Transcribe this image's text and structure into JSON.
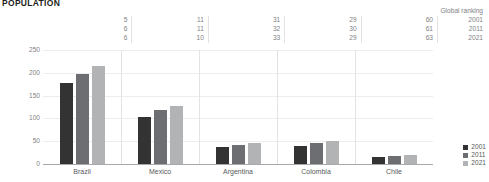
{
  "title": "POPULATION",
  "chart_data": {
    "type": "bar",
    "title": "POPULATION",
    "xlabel": "",
    "ylabel": "Millions",
    "ylim": [
      0,
      250
    ],
    "yticks": [
      250,
      200,
      150,
      100,
      50,
      0
    ],
    "grid": true,
    "legend_position": "right-bottom",
    "categories": [
      "Brazil",
      "Mexico",
      "Argentina",
      "Colombia",
      "Chile"
    ],
    "series": [
      {
        "name": "2001",
        "values": [
          177,
          103,
          37,
          40,
          15
        ]
      },
      {
        "name": "2011",
        "values": [
          197,
          118,
          41,
          46,
          17
        ]
      },
      {
        "name": "2021",
        "values": [
          214,
          128,
          46,
          51,
          19
        ]
      }
    ],
    "annotations": {
      "header": "Global ranking",
      "rows": [
        {
          "year": "2001",
          "values": [
            5,
            11,
            31,
            29,
            60
          ]
        },
        {
          "year": "2011",
          "values": [
            6,
            11,
            32,
            30,
            61
          ]
        },
        {
          "year": "2021",
          "values": [
            6,
            10,
            33,
            29,
            63
          ]
        }
      ]
    }
  },
  "legend": [
    {
      "label": "2001"
    },
    {
      "label": "2011"
    },
    {
      "label": "2021"
    }
  ],
  "colors": {
    "series_2001": "#333333",
    "series_2011": "#6d6e71",
    "series_2021": "#b2b3b5",
    "axis": "#a7a9ac",
    "grid": "#ededee",
    "text": "#58595b",
    "title": "#231f20"
  }
}
